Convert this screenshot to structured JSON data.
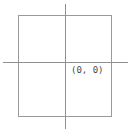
{
  "figure": {
    "background_color": "#ffffff",
    "line_color": "#8f8f8f",
    "rect_stroke_color": "#9a9a9a",
    "label_color": "#4a4a4a"
  },
  "chart_data": {
    "type": "scatter",
    "title": "",
    "subtitle": "",
    "xlabel": "",
    "ylabel": "",
    "grid": false,
    "legend": null,
    "axes": {
      "x_axis": {
        "label": "",
        "tick_labels": [],
        "range_px": [
          3,
          128
        ],
        "position_px_y": 62
      },
      "y_axis": {
        "label": "",
        "tick_labels": [],
        "range_px": [
          4,
          129
        ],
        "position_px_x": 65
      }
    },
    "annotations": [
      {
        "text": "(0, 0)",
        "x": 0,
        "y": 0,
        "role": "origin-label",
        "position_px": {
          "x": 71,
          "y": 64
        }
      }
    ],
    "shapes": [
      {
        "type": "rectangle",
        "role": "square-region",
        "filled": false,
        "stroke": "#9a9a9a",
        "bounds_px": {
          "left": 18,
          "top": 15,
          "width": 94,
          "height": 102
        }
      }
    ],
    "points": [
      {
        "label": "(0, 0)",
        "x": 0,
        "y": 0
      }
    ]
  },
  "labels": {
    "origin": "(0, 0)"
  }
}
